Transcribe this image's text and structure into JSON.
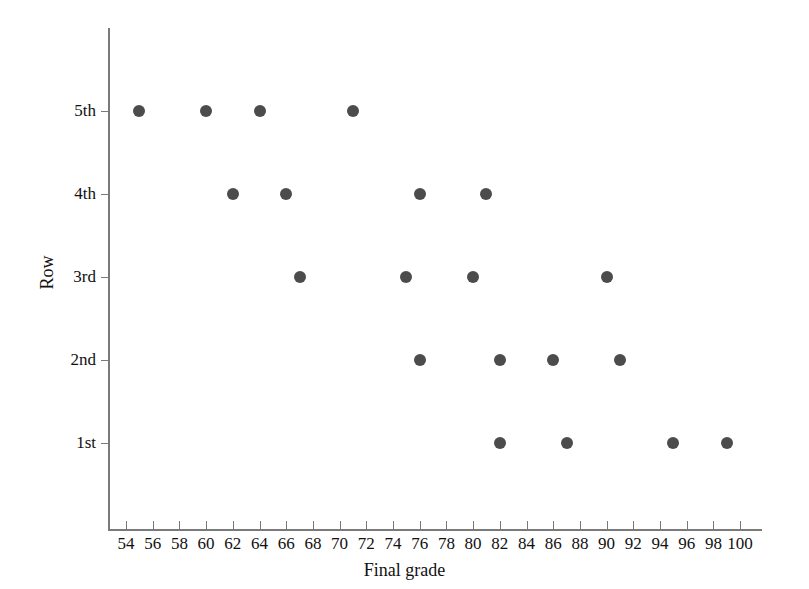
{
  "chart_data": {
    "type": "scatter",
    "title": "",
    "xlabel": "Final grade",
    "ylabel": "Row",
    "xlim": [
      53,
      101
    ],
    "ylim": [
      0.3,
      5.7
    ],
    "grid": false,
    "legend": null,
    "x_ticks": [
      54,
      56,
      58,
      60,
      62,
      64,
      66,
      68,
      70,
      72,
      74,
      76,
      78,
      80,
      82,
      84,
      86,
      88,
      90,
      92,
      94,
      96,
      98,
      100
    ],
    "x_tick_labels": [
      "54",
      "56",
      "58",
      "60",
      "62",
      "64",
      "66",
      "68",
      "70",
      "72",
      "74",
      "76",
      "78",
      "80",
      "82",
      "84",
      "86",
      "88",
      "90",
      "92",
      "94",
      "96",
      "98",
      "100"
    ],
    "y_categories": [
      "1st",
      "2nd",
      "3rd",
      "4th",
      "5th"
    ],
    "y_tick_labels": [
      "1st",
      "2nd",
      "3rd",
      "4th",
      "5th"
    ],
    "marker": "filled-circle",
    "marker_color": "#4c4c4c",
    "marker_size": 12,
    "points": [
      {
        "x": 55,
        "y": "5th"
      },
      {
        "x": 60,
        "y": "5th"
      },
      {
        "x": 64,
        "y": "5th"
      },
      {
        "x": 71,
        "y": "5th"
      },
      {
        "x": 62,
        "y": "4th"
      },
      {
        "x": 66,
        "y": "4th"
      },
      {
        "x": 76,
        "y": "4th"
      },
      {
        "x": 81,
        "y": "4th"
      },
      {
        "x": 67,
        "y": "3rd"
      },
      {
        "x": 75,
        "y": "3rd"
      },
      {
        "x": 80,
        "y": "3rd"
      },
      {
        "x": 90,
        "y": "3rd"
      },
      {
        "x": 76,
        "y": "2nd"
      },
      {
        "x": 82,
        "y": "2nd"
      },
      {
        "x": 86,
        "y": "2nd"
      },
      {
        "x": 91,
        "y": "2nd"
      },
      {
        "x": 82,
        "y": "1st"
      },
      {
        "x": 87,
        "y": "1st"
      },
      {
        "x": 95,
        "y": "1st"
      },
      {
        "x": 99,
        "y": "1st"
      }
    ],
    "series": [
      {
        "name": "grades by row",
        "values": [
          {
            "row": "5th",
            "grades": [
              55,
              60,
              64,
              71
            ]
          },
          {
            "row": "4th",
            "grades": [
              62,
              66,
              76,
              81
            ]
          },
          {
            "row": "3rd",
            "grades": [
              67,
              75,
              80,
              90
            ]
          },
          {
            "row": "2nd",
            "grades": [
              76,
              82,
              86,
              91
            ]
          },
          {
            "row": "1st",
            "grades": [
              82,
              87,
              95,
              99
            ]
          }
        ]
      }
    ]
  },
  "colors": {
    "marker": "#4c4c4c",
    "axis": "#7a7a7a",
    "text": "#111111",
    "background": "#ffffff"
  }
}
